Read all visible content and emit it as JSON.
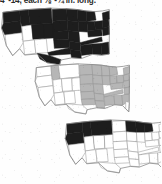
{
  "page": {
    "width": 161,
    "height": 184,
    "background_color": "#fefefe",
    "kind": "scanned-book-fragment"
  },
  "caption": {
    "text": "4\"-14, each ⅛\"-¼ in. long.",
    "clipped": true,
    "color": "#2b2b2b"
  },
  "colors": {
    "fill_dark": "#1d1d1d",
    "fill_gray": "#b6b6b6",
    "fill_empty": "#ffffff",
    "outline": "#9a9a9a",
    "border": "#8c8c8c"
  },
  "maps": [
    {
      "id": "map-1",
      "label": "range-map-1",
      "fill_style": "dark",
      "description": "United States range map, nearly the entire country filled solid dark; Pacific Southwest left unfilled.",
      "filled_regions": [
        "Washington",
        "Oregon",
        "Idaho",
        "Montana",
        "Wyoming",
        "North Dakota",
        "South Dakota",
        "Nebraska",
        "Kansas",
        "Minnesota",
        "Iowa",
        "Missouri",
        "Wisconsin",
        "Illinois",
        "Michigan",
        "Indiana",
        "Ohio",
        "Kentucky",
        "Tennessee",
        "West Virginia",
        "Virginia",
        "Pennsylvania",
        "New York",
        "Vermont",
        "New Hampshire",
        "Maine",
        "Massachusetts",
        "Connecticut",
        "Rhode Island",
        "New Jersey",
        "Delaware",
        "Maryland",
        "North Carolina",
        "South Carolina",
        "Georgia",
        "Florida",
        "Alabama",
        "Mississippi",
        "Louisiana",
        "Arkansas",
        "Oklahoma",
        "Texas",
        "Colorado",
        "Utah"
      ],
      "unfilled_regions": [
        "California",
        "Nevada",
        "Arizona",
        "New Mexico"
      ]
    },
    {
      "id": "map-2",
      "label": "range-map-2",
      "fill_style": "gray",
      "description": "United States range map with medium-gray shading over the eastern half and Great Plains, plus a small isolated patch in the northern Rockies.",
      "filled_regions": [
        "North Dakota",
        "South Dakota",
        "Nebraska",
        "Kansas",
        "Oklahoma",
        "Minnesota",
        "Iowa",
        "Missouri",
        "Arkansas",
        "Louisiana",
        "Wisconsin",
        "Illinois",
        "Michigan",
        "Indiana",
        "Ohio",
        "Kentucky",
        "Tennessee",
        "Mississippi",
        "Alabama",
        "Georgia",
        "West Virginia",
        "Virginia",
        "North Carolina",
        "South Carolina",
        "Pennsylvania",
        "New York",
        "Vermont",
        "New Hampshire",
        "Maine",
        "Massachusetts",
        "Connecticut",
        "Rhode Island",
        "New Jersey",
        "Delaware",
        "Maryland",
        "Idaho"
      ],
      "unfilled_regions": [
        "Washington",
        "Oregon",
        "California",
        "Nevada",
        "Utah",
        "Arizona",
        "New Mexico",
        "Colorado",
        "Wyoming",
        "Montana",
        "Texas",
        "Florida"
      ]
    },
    {
      "id": "map-3",
      "label": "range-map-3",
      "fill_style": "dark",
      "description": "United States range map with solid dark shading over the Pacific Northwest / northern Rockies and a second block across the western Great Lakes.",
      "filled_regions": [
        "Washington",
        "Oregon",
        "Idaho",
        "Montana",
        "Wyoming",
        "Minnesota",
        "Wisconsin",
        "Michigan"
      ],
      "unfilled_regions": [
        "California",
        "Nevada",
        "Utah",
        "Arizona",
        "New Mexico",
        "Colorado",
        "North Dakota",
        "South Dakota",
        "Nebraska",
        "Kansas",
        "Oklahoma",
        "Texas",
        "Iowa",
        "Missouri",
        "Arkansas",
        "Louisiana",
        "Illinois",
        "Indiana",
        "Ohio",
        "Kentucky",
        "Tennessee",
        "Mississippi",
        "Alabama",
        "Georgia",
        "Florida",
        "South Carolina",
        "North Carolina",
        "Virginia",
        "West Virginia",
        "Pennsylvania",
        "New York",
        "New England"
      ]
    }
  ]
}
